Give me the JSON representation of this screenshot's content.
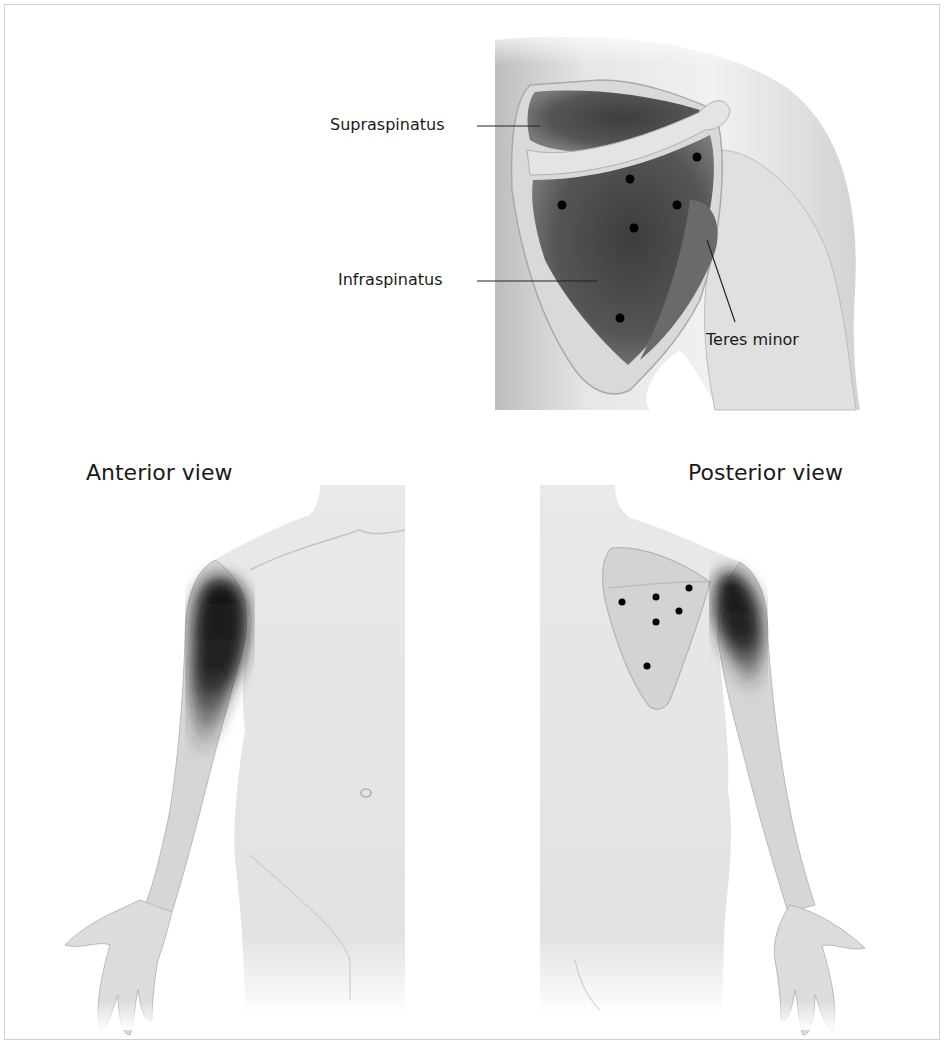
{
  "figure": {
    "top_panel": {
      "labels": {
        "supraspinatus": "Supraspinatus",
        "infraspinatus": "Infraspinatus",
        "teres_minor": "Teres minor"
      },
      "trigger_points": [
        {
          "x": 697,
          "y": 157
        },
        {
          "x": 630,
          "y": 179
        },
        {
          "x": 562,
          "y": 205
        },
        {
          "x": 677,
          "y": 205
        },
        {
          "x": 634,
          "y": 228
        },
        {
          "x": 620,
          "y": 318
        }
      ]
    },
    "anterior": {
      "title": "Anterior view"
    },
    "posterior": {
      "title": "Posterior view",
      "trigger_points": [
        {
          "x": 622,
          "y": 602
        },
        {
          "x": 656,
          "y": 597
        },
        {
          "x": 689,
          "y": 588
        },
        {
          "x": 679,
          "y": 611
        },
        {
          "x": 656,
          "y": 622
        },
        {
          "x": 647,
          "y": 666
        }
      ]
    },
    "colors": {
      "background": "#ffffff",
      "skin": "#ececec",
      "skin_shade": "#c9c9c9",
      "muscle_dark": "#4a4a4a",
      "referral_pain": "#1c1c1c",
      "trigger_point": "#000000",
      "text": "#1a1a1a",
      "frame": "#cfcfcf"
    }
  }
}
